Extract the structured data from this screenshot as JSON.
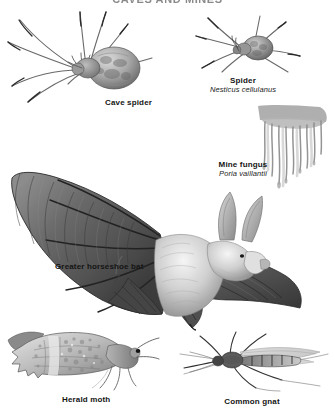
{
  "plate": {
    "title": "CAVES AND MINES",
    "title_cropped": true,
    "background_color": "#ffffff",
    "ink_color": "#141414"
  },
  "specimens": [
    {
      "key": "cave-spider",
      "common_name": "Cave spider",
      "scientific_name": "",
      "icon": "cave-spider-illustration"
    },
    {
      "key": "spider",
      "common_name": "Spider",
      "scientific_name": "Nesticus cellulanus",
      "icon": "spider-illustration"
    },
    {
      "key": "mine-fungus",
      "common_name": "Mine fungus",
      "scientific_name": "Poria vaillantii",
      "icon": "mine-fungus-illustration"
    },
    {
      "key": "greater-horseshoe-bat",
      "common_name": "Greater horseshoe bat",
      "scientific_name": "",
      "icon": "bat-illustration"
    },
    {
      "key": "herald-moth",
      "common_name": "Herald moth",
      "scientific_name": "",
      "icon": "moth-illustration"
    },
    {
      "key": "common-gnat",
      "common_name": "Common gnat",
      "scientific_name": "",
      "icon": "gnat-illustration"
    }
  ]
}
